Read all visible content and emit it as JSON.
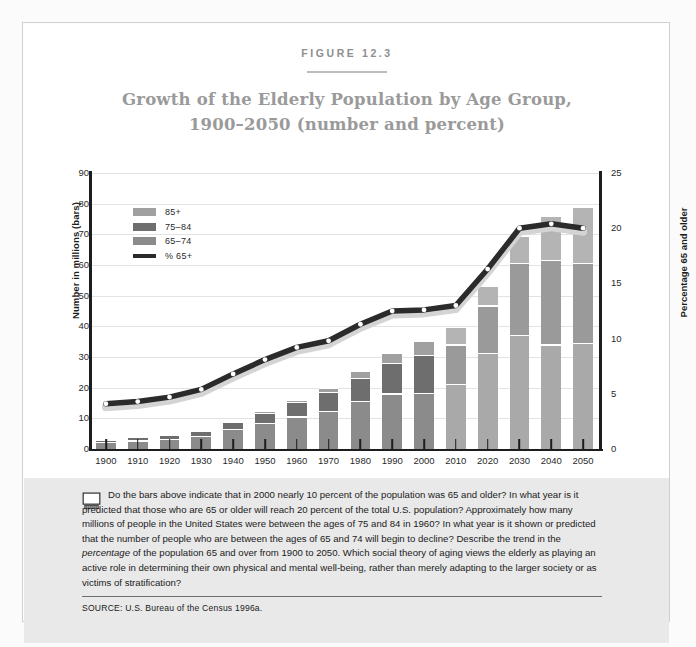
{
  "figure": {
    "label": "FIGURE 12.3",
    "title_line1": "Growth of the Elderly Population by Age Group,",
    "title_line2": "1900–2050 (number and percent)"
  },
  "caption": {
    "icon": "computer-monitor-icon",
    "text_part1": "Do the bars above indicate that in 2000 nearly 10 percent of the population was 65 and older? In what year is it predicted that those who are 65 or older will reach 20 percent of the total U.S. population? Approximately how many millions of people in the United States were between the ages of 75 and 84 in 1960? In what year is it shown or predicted that the number of people who are between the ages of 65 and 74 will begin to decline? Describe the trend in the ",
    "italic_word": "percentage",
    "text_part2": " of the population 65 and over from 1900 to 2050. Which social theory of aging views the elderly as playing an active role in determining their own physical and mental well-being, rather than merely adapting to the larger society or as victims of stratification?",
    "source": "SOURCE: U.S. Bureau of the Census 1996a."
  },
  "colors": {
    "seg_65_74": "#8b8b8b",
    "seg_75_84": "#6e6e6e",
    "seg_85_plus": "#a0a0a0",
    "seg_65_74_proj": "#a9a9a9",
    "seg_75_84_proj": "#9a9a9a",
    "seg_85_plus_proj": "#b4b4b4",
    "line": "#2b2b2b",
    "line_shadow": "#d4d4d4",
    "title": "#9a9a9a",
    "grid": "#e3e3e3",
    "caption_bg": "#e9e9e9"
  },
  "chart_data": {
    "type": "bar",
    "title": "Growth of the Elderly Population by Age Group, 1900–2050 (number and percent)",
    "xlabel": "",
    "ylabel": "Number in millions (bars)",
    "y2label": "Percentage 65 and older",
    "ylim": [
      0,
      90
    ],
    "y2lim": [
      0,
      25
    ],
    "yticks": [
      0,
      10,
      20,
      30,
      40,
      50,
      60,
      70,
      80,
      90
    ],
    "y2ticks": [
      0,
      5,
      10,
      15,
      20,
      25
    ],
    "grid": true,
    "legend_position": "upper-left-inside",
    "categories": [
      "1900",
      "1910",
      "1920",
      "1930",
      "1940",
      "1950",
      "1960",
      "1970",
      "1980",
      "1990",
      "2000",
      "2010",
      "2020",
      "2030",
      "2040",
      "2050"
    ],
    "projection_start": "2010",
    "series": [
      {
        "name": "65–74",
        "type": "bar-stack",
        "values": [
          2.2,
          2.8,
          3.4,
          4.4,
          6.4,
          8.4,
          10.6,
          12.4,
          15.6,
          18.1,
          18.4,
          21.1,
          31.4,
          37.3,
          34.1,
          34.7
        ]
      },
      {
        "name": "75–84",
        "type": "bar-stack",
        "values": [
          0.8,
          1.0,
          1.3,
          1.6,
          2.3,
          3.3,
          4.6,
          6.1,
          7.7,
          10.1,
          12.4,
          13.0,
          15.4,
          23.4,
          27.6,
          26.0
        ]
      },
      {
        "name": "85+",
        "type": "bar-stack",
        "values": [
          0.1,
          0.2,
          0.2,
          0.3,
          0.4,
          0.6,
          0.9,
          1.4,
          2.2,
          3.1,
          4.3,
          5.7,
          6.5,
          8.8,
          14.3,
          18.2
        ]
      },
      {
        "name": "% 65+",
        "type": "line",
        "axis": "right",
        "values": [
          4.1,
          4.3,
          4.7,
          5.4,
          6.8,
          8.1,
          9.2,
          9.8,
          11.3,
          12.5,
          12.6,
          13.0,
          16.3,
          20.0,
          20.4,
          20.0
        ]
      }
    ],
    "legend": [
      "85+",
      "75–84",
      "65–74",
      "% 65+"
    ]
  }
}
